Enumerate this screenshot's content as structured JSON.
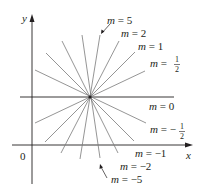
{
  "diagram": {
    "type": "family of lines through a point",
    "axes": {
      "x_label": "x",
      "y_label": "y",
      "origin_label": "0"
    },
    "center": {
      "px": [
        90,
        97
      ]
    },
    "lines": [
      {
        "m": "5",
        "label": "m = 5"
      },
      {
        "m": "2",
        "label": "m = 2"
      },
      {
        "m": "1",
        "label": "m = 1"
      },
      {
        "m": "1/2",
        "label": "m = 1/2"
      },
      {
        "m": "0",
        "label": "m = 0"
      },
      {
        "m": "-1/2",
        "label": "m = −1/2"
      },
      {
        "m": "-1",
        "label": "m = −1"
      },
      {
        "m": "-2",
        "label": "m = −2"
      },
      {
        "m": "-5",
        "label": "m = −5"
      }
    ],
    "labels": {
      "m5": {
        "m": "m",
        "eq": " = 5"
      },
      "m2": {
        "m": "m",
        "eq": " = 2"
      },
      "m1": {
        "m": "m",
        "eq": " = 1"
      },
      "mhalf": {
        "m": "m",
        "eq": " = ",
        "num": "1",
        "den": "2"
      },
      "m0": {
        "m": "m",
        "eq": " = 0"
      },
      "mneghalf": {
        "m": "m",
        "eq": " = −",
        "num": "1",
        "den": "2"
      },
      "mneg1": {
        "m": "m",
        "eq": " = −1"
      },
      "mneg2": {
        "m": "m",
        "eq": " = −2"
      },
      "mneg5": {
        "m": "m",
        "eq": " = −5"
      }
    }
  }
}
